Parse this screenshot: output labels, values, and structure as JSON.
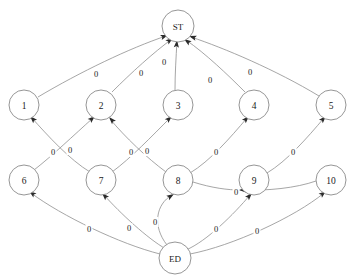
{
  "diagram": {
    "type": "node-link-diagram",
    "colors": {
      "node_stroke": "#8a8a8a",
      "node_fill": "#ffffff",
      "edge_stroke": "#8f8f8f",
      "arrow_fill": "#2b2b2b",
      "text": "#1a1a1a",
      "background": "#ffffff"
    },
    "nodes": [
      {
        "id": "ST",
        "label": "ST",
        "x": 178,
        "y": 26,
        "r": 16,
        "layer": "top"
      },
      {
        "id": "n1",
        "label": "1",
        "x": 24,
        "y": 105,
        "r": 15,
        "layer": "upper"
      },
      {
        "id": "n2",
        "label": "2",
        "x": 101,
        "y": 105,
        "r": 15,
        "layer": "upper"
      },
      {
        "id": "n3",
        "label": "3",
        "x": 178,
        "y": 105,
        "r": 15,
        "layer": "upper"
      },
      {
        "id": "n4",
        "label": "4",
        "x": 254,
        "y": 105,
        "r": 15,
        "layer": "upper"
      },
      {
        "id": "n5",
        "label": "5",
        "x": 331,
        "y": 105,
        "r": 15,
        "layer": "upper"
      },
      {
        "id": "n6",
        "label": "6",
        "x": 24,
        "y": 180,
        "r": 15,
        "layer": "lower"
      },
      {
        "id": "n7",
        "label": "7",
        "x": 101,
        "y": 180,
        "r": 15,
        "layer": "lower"
      },
      {
        "id": "n8",
        "label": "8",
        "x": 178,
        "y": 180,
        "r": 15,
        "layer": "lower"
      },
      {
        "id": "n9",
        "label": "9",
        "x": 254,
        "y": 180,
        "r": 15,
        "layer": "lower"
      },
      {
        "id": "n10",
        "label": "10",
        "x": 331,
        "y": 180,
        "r": 15,
        "layer": "lower"
      },
      {
        "id": "ED",
        "label": "ED",
        "x": 175,
        "y": 258,
        "r": 16,
        "layer": "bottom"
      }
    ],
    "edges": [
      {
        "id": "e1",
        "from": "n1",
        "to": "ST",
        "label": "0",
        "path": "M 38 97 C 80 72 130 48 166 36",
        "label_x": 96,
        "label_y": 74,
        "arrow_x": 168,
        "arrow_y": 35,
        "arrow_angle": -19
      },
      {
        "id": "e2",
        "from": "n2",
        "to": "ST",
        "label": "0",
        "path": "M 112 92 C 131 73 154 52 172 39",
        "label_x": 141,
        "label_y": 73,
        "arrow_x": 173,
        "arrow_y": 38,
        "arrow_angle": -36
      },
      {
        "id": "e3",
        "from": "n3",
        "to": "ST",
        "label": "0",
        "path": "M 175 90 C 175 74 176 58 177 41",
        "label_x": 164,
        "label_y": 62,
        "arrow_x": 177,
        "arrow_y": 40,
        "arrow_angle": -85
      },
      {
        "id": "e4",
        "from": "n4",
        "to": "ST",
        "label": "0",
        "path": "M 245 92 C 227 74 206 54 186 40",
        "label_x": 210,
        "label_y": 80,
        "arrow_x": 184,
        "arrow_y": 39,
        "arrow_angle": -145
      },
      {
        "id": "e5",
        "from": "n5",
        "to": "ST",
        "label": "0",
        "path": "M 319 96 C 276 70 224 48 191 37",
        "label_x": 250,
        "label_y": 72,
        "arrow_x": 189,
        "arrow_y": 36,
        "arrow_angle": -162
      },
      {
        "id": "e6",
        "from": "n7",
        "to": "n1",
        "label": "0",
        "path": "M 90 172 C 70 160 48 136 31 117",
        "label_x": 53,
        "label_y": 152,
        "arrow_x": 30,
        "arrow_y": 116,
        "arrow_angle": -133
      },
      {
        "id": "e7",
        "from": "n6",
        "to": "n2",
        "label": "0",
        "path": "M 34 170 C 52 156 74 135 93 118",
        "label_x": 70,
        "label_y": 150,
        "arrow_x": 95,
        "arrow_y": 116,
        "arrow_angle": -42
      },
      {
        "id": "e8",
        "from": "n8",
        "to": "n2",
        "label": "0",
        "path": "M 166 172 C 147 158 125 137 110 119",
        "label_x": 131,
        "label_y": 152,
        "arrow_x": 109,
        "arrow_y": 117,
        "arrow_angle": -132
      },
      {
        "id": "e9",
        "from": "n7",
        "to": "n3",
        "label": "0",
        "path": "M 112 172 C 131 158 152 136 170 118",
        "label_x": 147,
        "label_y": 151,
        "arrow_x": 172,
        "arrow_y": 116,
        "arrow_angle": -43
      },
      {
        "id": "e10",
        "from": "n8",
        "to": "n4",
        "label": "0",
        "path": "M 190 173 C 210 161 230 138 247 118",
        "label_x": 216,
        "label_y": 152,
        "arrow_x": 249,
        "arrow_y": 116,
        "arrow_angle": -47
      },
      {
        "id": "e11",
        "from": "n9",
        "to": "n5",
        "label": "0",
        "path": "M 267 173 C 287 161 307 138 324 118",
        "label_x": 293,
        "label_y": 152,
        "arrow_x": 326,
        "arrow_y": 116,
        "arrow_angle": -47
      },
      {
        "id": "e12",
        "from": "ED",
        "to": "n6",
        "label": "0",
        "path": "M 160 254 C 120 244 62 216 31 193",
        "label_x": 89,
        "label_y": 229,
        "arrow_x": 29,
        "arrow_y": 191,
        "arrow_angle": -143
      },
      {
        "id": "e13",
        "from": "ED",
        "to": "n7",
        "label": "0",
        "path": "M 166 249 C 148 239 120 213 104 195",
        "label_x": 129,
        "label_y": 228,
        "arrow_x": 102,
        "arrow_y": 193,
        "arrow_angle": -133
      },
      {
        "id": "e14",
        "from": "ED",
        "to": "n8",
        "label": "0",
        "path": "M 167 245 C 152 226 156 204 172 195",
        "label_x": 155,
        "label_y": 222,
        "arrow_x": 174,
        "arrow_y": 194,
        "arrow_angle": -32
      },
      {
        "id": "e15",
        "from": "ED",
        "to": "n9",
        "label": "0",
        "path": "M 186 250 C 207 241 234 214 250 195",
        "label_x": 216,
        "label_y": 229,
        "arrow_x": 252,
        "arrow_y": 193,
        "arrow_angle": -48
      },
      {
        "id": "e16",
        "from": "ED",
        "to": "n10",
        "label": "0",
        "path": "M 190 254 C 232 246 295 217 324 193",
        "label_x": 257,
        "label_y": 231,
        "arrow_x": 326,
        "arrow_y": 191,
        "arrow_angle": -40
      },
      {
        "id": "e17",
        "from": "n10",
        "to": "n9",
        "label": "0",
        "path": "M 316 181 C 296 188 268 191 240 190",
        "label_x": 236,
        "label_y": 192,
        "arrow_x": 239,
        "arrow_y": 190,
        "arrow_angle": 182
      },
      {
        "id": "e18",
        "from": "n8",
        "to": "n9",
        "label": "0",
        "path": "M 193 182 C 212 188 228 190 240 190",
        "label_x": 0,
        "label_y": 0,
        "arrow_x": 0,
        "arrow_y": 0,
        "arrow_angle": 0
      }
    ]
  }
}
